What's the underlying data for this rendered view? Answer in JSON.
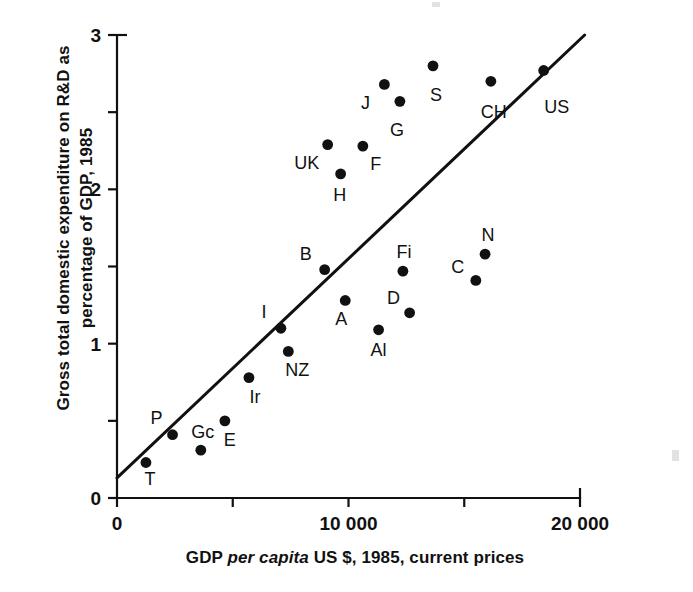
{
  "chart_data": {
    "type": "scatter",
    "title": "",
    "xlabel": "GDP per capita US $, 1985, current prices",
    "xlabel_parts": {
      "pre": "GDP ",
      "italic": "per capita",
      "post": " US $, 1985, current prices"
    },
    "ylabel": "Gross total domestic expenditure on R&D as percentage of GDP, 1985",
    "ylabel_line1": "Gross total domestic expenditure on R&D as",
    "ylabel_line2": "percentage of GDP, 1985",
    "xlim": [
      0,
      20000
    ],
    "ylim": [
      0,
      3
    ],
    "xticks": [
      0,
      5000,
      10000,
      15000,
      20000
    ],
    "xtick_labels": [
      "0",
      "",
      "10 000",
      "",
      "20 000"
    ],
    "yticks": [
      0,
      0.5,
      1,
      1.5,
      2,
      2.5,
      3
    ],
    "ytick_labels": [
      "0",
      "",
      "1",
      "",
      "2",
      "",
      "3"
    ],
    "grid": false,
    "legend": "none",
    "point_color": "#111111",
    "line_color": "#111111",
    "trend_line": {
      "label": "regression line",
      "x0": 0,
      "y0": 0.13,
      "x1": 20200,
      "y1": 3.0
    },
    "points": [
      {
        "label": "T",
        "x": 1250,
        "y": 0.23,
        "label_dx": 4,
        "label_dy": 22
      },
      {
        "label": "P",
        "x": 2400,
        "y": 0.41,
        "label_dx": -16,
        "label_dy": -11
      },
      {
        "label": "Gc",
        "x": 3620,
        "y": 0.31,
        "label_dx": 2,
        "label_dy": -12
      },
      {
        "label": "E",
        "x": 4660,
        "y": 0.5,
        "label_dx": 5,
        "label_dy": 25
      },
      {
        "label": "Ir",
        "x": 5700,
        "y": 0.78,
        "label_dx": 6,
        "label_dy": 25
      },
      {
        "label": "NZ",
        "x": 7400,
        "y": 0.95,
        "label_dx": 9,
        "label_dy": 25
      },
      {
        "label": "I",
        "x": 7080,
        "y": 1.1,
        "label_dx": -17,
        "label_dy": -10
      },
      {
        "label": "A",
        "x": 9860,
        "y": 1.28,
        "label_dx": -4,
        "label_dy": 25
      },
      {
        "label": "Al",
        "x": 11300,
        "y": 1.09,
        "label_dx": 0,
        "label_dy": 26
      },
      {
        "label": "B",
        "x": 8970,
        "y": 1.48,
        "label_dx": -19,
        "label_dy": -10
      },
      {
        "label": "D",
        "x": 12640,
        "y": 1.2,
        "label_dx": -16,
        "label_dy": -9
      },
      {
        "label": "Fi",
        "x": 12350,
        "y": 1.47,
        "label_dx": 1,
        "label_dy": -13
      },
      {
        "label": "C",
        "x": 15500,
        "y": 1.41,
        "label_dx": -18,
        "label_dy": -7
      },
      {
        "label": "N",
        "x": 15900,
        "y": 1.58,
        "label_dx": 3,
        "label_dy": -13
      },
      {
        "label": "H",
        "x": 9660,
        "y": 2.1,
        "label_dx": -1,
        "label_dy": 27
      },
      {
        "label": "UK",
        "x": 9100,
        "y": 2.29,
        "label_dx": -21,
        "label_dy": 24
      },
      {
        "label": "F",
        "x": 10620,
        "y": 2.28,
        "label_dx": 13,
        "label_dy": 24
      },
      {
        "label": "J",
        "x": 11550,
        "y": 2.68,
        "label_dx": -19,
        "label_dy": 25
      },
      {
        "label": "G",
        "x": 12220,
        "y": 2.57,
        "label_dx": -3,
        "label_dy": 35
      },
      {
        "label": "S",
        "x": 13650,
        "y": 2.8,
        "label_dx": 3,
        "label_dy": 35
      },
      {
        "label": "CH",
        "x": 16150,
        "y": 2.7,
        "label_dx": 3,
        "label_dy": 37
      },
      {
        "label": "US",
        "x": 18430,
        "y": 2.77,
        "label_dx": 13,
        "label_dy": 43
      }
    ]
  },
  "axes": {
    "x_origin_px": 117,
    "y_origin_px": 498,
    "x_max_px": 580,
    "y_top_px": 35
  }
}
